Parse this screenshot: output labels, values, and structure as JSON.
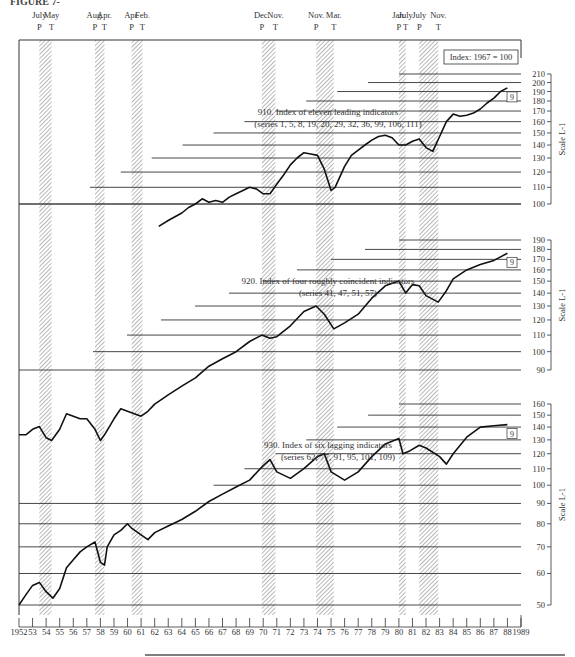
{
  "figure": {
    "label": "FIGURE 7-",
    "index_box": "Index: 1967 = 100",
    "scale_label": "Scale L-1",
    "box_marker": "9"
  },
  "turning_points": [
    {
      "month": "July",
      "type": "P",
      "year": 1953.5
    },
    {
      "month": "May",
      "type": "T",
      "year": 1954.4
    },
    {
      "month": "Aug.",
      "type": "P",
      "year": 1957.6
    },
    {
      "month": "Apr.",
      "type": "T",
      "year": 1958.3
    },
    {
      "month": "Apr.",
      "type": "P",
      "year": 1960.3
    },
    {
      "month": "Feb.",
      "type": "T",
      "year": 1961.1
    },
    {
      "month": "Dec.",
      "type": "P",
      "year": 1969.9
    },
    {
      "month": "Nov.",
      "type": "T",
      "year": 1970.9
    },
    {
      "month": "Nov.",
      "type": "P",
      "year": 1973.9
    },
    {
      "month": "Mar.",
      "type": "T",
      "year": 1975.2
    },
    {
      "month": "Jan.",
      "type": "P",
      "year": 1980.0
    },
    {
      "month": "July",
      "type": "T",
      "year": 1980.5
    },
    {
      "month": "July",
      "type": "P",
      "year": 1981.5
    },
    {
      "month": "Nov.",
      "type": "T",
      "year": 1982.9
    }
  ],
  "chart_data": {
    "type": "line",
    "x_label": "",
    "x_ticks": [
      "1952",
      "53",
      "54",
      "55",
      "56",
      "57",
      "58",
      "59",
      "60",
      "61",
      "62",
      "63",
      "64",
      "65",
      "66",
      "67",
      "68",
      "69",
      "70",
      "71",
      "72",
      "73",
      "74",
      "75",
      "76",
      "77",
      "78",
      "79",
      "80",
      "81",
      "82",
      "83",
      "84",
      "85",
      "86",
      "87",
      "88",
      "1989"
    ],
    "xlim": [
      1952,
      1989
    ],
    "recessions": [
      [
        1953.5,
        1954.4
      ],
      [
        1957.6,
        1958.3
      ],
      [
        1960.3,
        1961.1
      ],
      [
        1969.9,
        1970.9
      ],
      [
        1973.9,
        1975.2
      ],
      [
        1980.0,
        1980.5
      ],
      [
        1981.5,
        1982.9
      ]
    ],
    "panels": [
      {
        "name": "910. Index of eleven leading indicators",
        "subtitle": "(series 1, 5, 8, 19, 20, 29, 32, 36, 99, 106, 111)",
        "scale": "log",
        "ylim": [
          100,
          210
        ],
        "y_ticks": [
          100,
          110,
          120,
          130,
          140,
          150,
          160,
          170,
          180,
          190,
          200,
          210
        ],
        "annotations": [
          "-8",
          "-1",
          "-8",
          "-1",
          "-10",
          "-3",
          "-8",
          "-3",
          "-8"
        ],
        "x": [
          1962.3,
          1963,
          1963.5,
          1964,
          1964.5,
          1965,
          1965.5,
          1966,
          1966.5,
          1967,
          1967.5,
          1968,
          1968.5,
          1969,
          1969.5,
          1970,
          1970.5,
          1971,
          1971.5,
          1972,
          1972.5,
          1973,
          1973.5,
          1974,
          1974.5,
          1975,
          1975.3,
          1976,
          1976.5,
          1977,
          1977.5,
          1978,
          1978.5,
          1979,
          1979.5,
          1980,
          1980.5,
          1981,
          1981.5,
          1982,
          1982.5,
          1983,
          1983.5,
          1984,
          1984.5,
          1985,
          1985.5,
          1986,
          1986.5,
          1987,
          1987.5,
          1988
        ],
        "values": [
          88,
          91,
          93,
          95,
          98,
          100,
          103,
          101,
          102,
          101,
          104,
          106,
          108,
          110,
          109,
          106,
          106,
          112,
          118,
          125,
          130,
          134,
          133,
          132,
          122,
          108,
          110,
          124,
          132,
          136,
          140,
          144,
          147,
          148,
          146,
          140,
          140,
          143,
          145,
          138,
          135,
          147,
          160,
          167,
          165,
          166,
          168,
          172,
          178,
          183,
          190,
          194
        ]
      },
      {
        "name": "920. Index of four roughly coincident indicators",
        "subtitle": "(series 41, 47, 51, 57)",
        "scale": "log",
        "ylim": [
          90,
          190
        ],
        "y_ticks": [
          90,
          100,
          110,
          120,
          130,
          140,
          150,
          160,
          170,
          180,
          190
        ],
        "annotations": [
          "-4",
          "-6",
          "-23",
          "-2",
          "-11",
          "-2",
          "-2",
          "0",
          "0",
          "0",
          "0",
          "0",
          "+1"
        ],
        "x": [
          1952,
          1952.5,
          1953,
          1953.5,
          1954,
          1954.4,
          1955,
          1955.5,
          1956,
          1956.5,
          1957,
          1957.6,
          1958,
          1958.3,
          1959,
          1959.5,
          1960,
          1960.5,
          1961,
          1961.5,
          1962,
          1963,
          1964,
          1965,
          1966,
          1967,
          1968,
          1969,
          1969.9,
          1970.5,
          1971,
          1972,
          1973,
          1973.9,
          1974.5,
          1975.2,
          1976,
          1977,
          1978,
          1979,
          1980,
          1980.5,
          1981,
          1981.5,
          1982,
          1982.9,
          1983.5,
          1984,
          1985,
          1986,
          1987,
          1988
        ],
        "values": [
          62,
          62,
          64,
          65,
          61,
          60,
          64,
          70,
          69,
          68,
          68,
          64,
          60,
          62,
          68,
          72,
          71,
          70,
          69,
          71,
          74,
          78,
          82,
          86,
          92,
          96,
          100,
          106,
          110,
          108,
          109,
          116,
          126,
          130,
          124,
          114,
          118,
          124,
          136,
          146,
          150,
          140,
          147,
          146,
          138,
          133,
          142,
          152,
          160,
          165,
          169,
          176
        ]
      },
      {
        "name": "930. Index of six lagging indicators",
        "subtitle": "(series 62, 77, 91, 95, 101, 109)",
        "scale": "log",
        "ylim": [
          50,
          160
        ],
        "y_ticks": [
          50,
          60,
          70,
          80,
          90,
          100,
          110,
          120,
          130,
          140,
          150,
          160
        ],
        "annotations": [
          "-2",
          "-3",
          "-6",
          "-3",
          "0",
          "+3",
          "+11",
          "+4",
          "+4",
          "+2",
          "+9",
          "+3",
          "+15",
          "+15",
          "+13",
          "+3",
          "+9",
          "+6",
          "+8"
        ],
        "x": [
          1952,
          1952.5,
          1953,
          1953.5,
          1954,
          1954.5,
          1955,
          1955.5,
          1956,
          1956.5,
          1957,
          1957.6,
          1958,
          1958.3,
          1958.5,
          1959,
          1959.5,
          1960,
          1960.3,
          1961,
          1961.5,
          1962,
          1963,
          1964,
          1965,
          1966,
          1967,
          1968,
          1969,
          1970,
          1970.5,
          1971,
          1972,
          1973,
          1974,
          1974.5,
          1975,
          1976,
          1977,
          1978,
          1979,
          1980,
          1980.3,
          1980.8,
          1981.5,
          1982,
          1983,
          1983.5,
          1984,
          1985,
          1986,
          1987,
          1988
        ],
        "values": [
          50,
          53,
          56,
          57,
          54,
          52,
          55,
          62,
          65,
          68,
          70,
          72,
          64,
          63,
          70,
          75,
          77,
          80,
          78,
          75,
          73,
          76,
          79,
          82,
          86,
          91,
          95,
          99,
          103,
          112,
          116,
          108,
          104,
          110,
          118,
          120,
          108,
          103,
          108,
          118,
          127,
          131,
          120,
          122,
          126,
          124,
          118,
          113,
          120,
          132,
          140,
          141,
          142
        ]
      }
    ]
  }
}
